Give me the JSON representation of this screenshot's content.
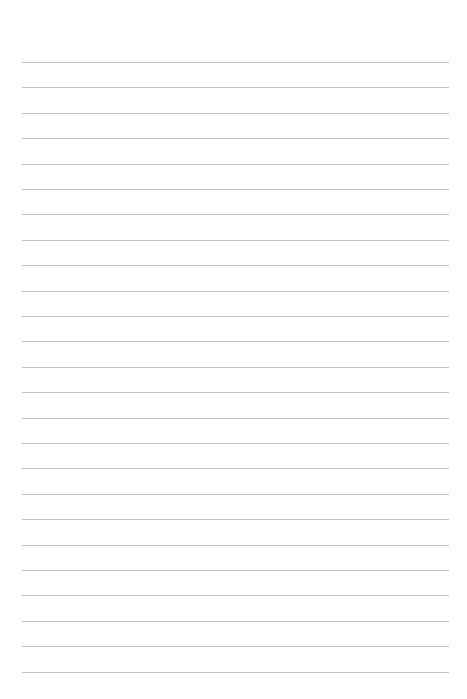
{
  "page": {
    "type": "lined-paper",
    "background_color": "#ffffff",
    "line_color": "#c2c2c2",
    "line_count": 25,
    "first_line_y": 62,
    "line_spacing": 25.4,
    "line_left": 22,
    "line_right": 449
  }
}
